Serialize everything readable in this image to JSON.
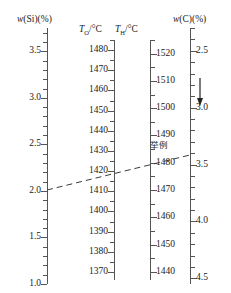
{
  "chart_data": {
    "type": "nomogram",
    "title": "",
    "subtitle": "",
    "xlabel": "",
    "ylabel": "",
    "grid": false,
    "legend": "none",
    "axes": [
      {
        "id": "si",
        "title_html": "w(Si)(%)",
        "title_base": "w",
        "title_rest": "(Si)(%)",
        "unit": "%",
        "direction": "descending",
        "range": [
          3.75,
          1.0
        ],
        "major_ticks": [
          "3.5",
          "3.0",
          "2.5",
          "2.0",
          "1.5",
          "1.0"
        ],
        "major_values": [
          3.5,
          3.0,
          2.5,
          2.0,
          1.5,
          1.0
        ],
        "minor_step": 0.1
      },
      {
        "id": "to",
        "title_base": "T",
        "title_sub": "O",
        "title_rest": "/°C",
        "unit": "°C",
        "direction": "descending",
        "range": [
          1485,
          1366
        ],
        "major_ticks": [
          "1480",
          "1470",
          "1460",
          "1450",
          "1440",
          "1430",
          "1420",
          "1410",
          "1400",
          "1390",
          "1380",
          "1370"
        ],
        "major_values": [
          1480,
          1470,
          1460,
          1450,
          1440,
          1430,
          1420,
          1410,
          1400,
          1390,
          1380,
          1370
        ],
        "minor_step": 5
      },
      {
        "id": "th",
        "title_base": "T",
        "title_sub": "H",
        "title_rest": "/°C",
        "unit": "°C",
        "direction": "descending",
        "range": [
          1525,
          1437
        ],
        "major_ticks": [
          "1520",
          "1510",
          "1500",
          "1490",
          "1480",
          "1470",
          "1460",
          "1450",
          "1440"
        ],
        "major_values": [
          1520,
          1510,
          1500,
          1490,
          1480,
          1470,
          1460,
          1450,
          1440
        ],
        "minor_step": 5
      },
      {
        "id": "c",
        "title_base": "w",
        "title_rest": "(C)(%)",
        "unit": "%",
        "direction": "ascending-downward",
        "range": [
          2.3,
          4.55
        ],
        "major_ticks": [
          "2.5",
          "3.0",
          "3.5",
          "4.0",
          "4.5"
        ],
        "major_values": [
          2.5,
          3.0,
          3.5,
          4.0,
          4.5
        ],
        "minor_step": 0.1
      }
    ],
    "annotations": [
      {
        "name": "example-label",
        "text": "举例",
        "meaning": "example"
      },
      {
        "name": "direction-arrow",
        "text": "↓",
        "axis": "c",
        "meaning": "increasing-carbon-direction"
      }
    ],
    "example_line": {
      "style": "dashed",
      "color": "#3a3a3a",
      "readings": {
        "si_percent": 1.55,
        "to_celsius": 1417,
        "th_celsius": 1479,
        "c_percent": 3.2
      }
    },
    "colors": {
      "axis": "#555555",
      "text": "#1a1a1a",
      "dash": "#3a3a3a",
      "background": "#ffffff"
    }
  }
}
